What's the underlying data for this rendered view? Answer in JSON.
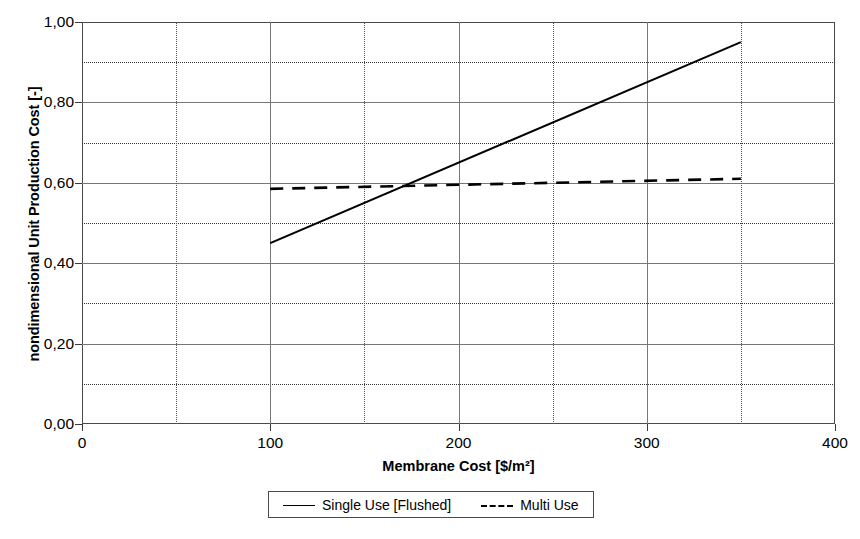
{
  "chart_data": {
    "type": "line",
    "title": "",
    "xlabel": "Membrane Cost [$/m²]",
    "ylabel": "nondimensional Unit Production Cost [-]",
    "xlim": [
      0,
      400
    ],
    "ylim": [
      0.0,
      1.0
    ],
    "x_major_ticks": [
      0,
      100,
      200,
      300,
      400
    ],
    "x_major_tick_labels": [
      "0",
      "100",
      "200",
      "300",
      "400"
    ],
    "x_minor_gridlines": [
      50,
      150,
      250,
      350
    ],
    "y_major_ticks": [
      0.0,
      0.2,
      0.4,
      0.6,
      0.8,
      1.0
    ],
    "y_major_tick_labels": [
      "0,00",
      "0,20",
      "0,40",
      "0,60",
      "0,80",
      "1,00"
    ],
    "y_minor_gridlines": [
      0.1,
      0.3,
      0.5,
      0.7,
      0.9
    ],
    "grid": true,
    "legend_position": "bottom-center",
    "decimal_separator": ",",
    "series": [
      {
        "name": "Single Use [Flushed]",
        "style": "solid",
        "color": "#000000",
        "x": [
          100,
          350
        ],
        "values": [
          0.45,
          0.95
        ]
      },
      {
        "name": "Multi Use",
        "style": "dashed",
        "color": "#000000",
        "x": [
          100,
          350
        ],
        "values": [
          0.585,
          0.61
        ]
      }
    ],
    "annotations": [
      {
        "text": "crossover",
        "x": 170,
        "y": 0.6
      }
    ]
  },
  "axes": {
    "y_title": "nondimensional Unit Production Cost [-]",
    "x_title": "Membrane Cost [$/m²]"
  },
  "legend": {
    "entries": [
      {
        "label": "Single Use [Flushed]",
        "style": "solid"
      },
      {
        "label": "Multi Use",
        "style": "dashed"
      }
    ]
  },
  "caption": {
    "text": ""
  }
}
